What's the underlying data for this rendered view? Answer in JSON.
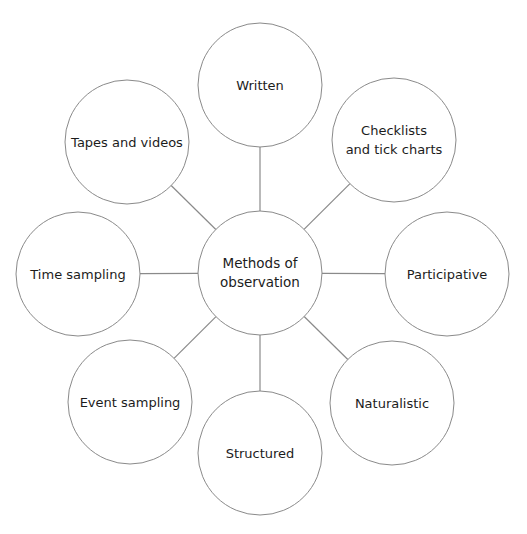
{
  "diagram": {
    "type": "mind-map",
    "colors": {
      "stroke": "#8a8a8a",
      "text": "#1c1c1c",
      "background": "#ffffff"
    },
    "center": {
      "label": "Methods of\nobservation",
      "cx": 260,
      "cy": 273,
      "r": 62
    },
    "nodes": [
      {
        "id": "written",
        "label": "Written",
        "cx": 260,
        "cy": 85,
        "r": 62
      },
      {
        "id": "checklists",
        "label": "Checklists\nand tick charts",
        "cx": 394,
        "cy": 140,
        "r": 62
      },
      {
        "id": "participative",
        "label": "Participative",
        "cx": 447,
        "cy": 274,
        "r": 62
      },
      {
        "id": "naturalistic",
        "label": "Naturalistic",
        "cx": 392,
        "cy": 403,
        "r": 62
      },
      {
        "id": "structured",
        "label": "Structured",
        "cx": 260,
        "cy": 453,
        "r": 62
      },
      {
        "id": "event-sampling",
        "label": "Event sampling",
        "cx": 130,
        "cy": 402,
        "r": 62
      },
      {
        "id": "time-sampling",
        "label": "Time sampling",
        "cx": 78,
        "cy": 274,
        "r": 62
      },
      {
        "id": "tapes-videos",
        "label": "Tapes and videos",
        "cx": 127,
        "cy": 142,
        "r": 62
      }
    ]
  }
}
